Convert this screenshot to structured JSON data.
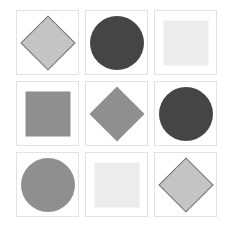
{
  "puzzle": {
    "rows": 3,
    "cols": 3,
    "cells": [
      {
        "shape": "diamond",
        "fill": "#c4c4c4",
        "stroke": "#707070"
      },
      {
        "shape": "circle",
        "fill": "#454545",
        "stroke": ""
      },
      {
        "shape": "square",
        "fill": "#ececec",
        "stroke": ""
      },
      {
        "shape": "square",
        "fill": "#8f8f8f",
        "stroke": ""
      },
      {
        "shape": "diamond",
        "fill": "#8f8f8f",
        "stroke": ""
      },
      {
        "shape": "circle",
        "fill": "#454545",
        "stroke": ""
      },
      {
        "shape": "circle",
        "fill": "#8f8f8f",
        "stroke": ""
      },
      {
        "shape": "square",
        "fill": "#ececec",
        "stroke": ""
      },
      {
        "shape": "diamond",
        "fill": "#c4c4c4",
        "stroke": "#707070"
      }
    ]
  },
  "colors": {
    "cell_border": "#e2e2e2",
    "background": "#ffffff"
  }
}
